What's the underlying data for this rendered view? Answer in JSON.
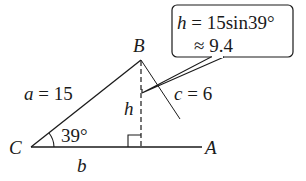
{
  "diagram": {
    "type": "triangle",
    "vertices": {
      "C": {
        "label": "C"
      },
      "B": {
        "label": "B"
      },
      "A": {
        "label": "A"
      }
    },
    "sides": {
      "a": {
        "var": "a",
        "eq": "=",
        "value": "15"
      },
      "c": {
        "var": "c",
        "eq": "=",
        "value": "6"
      },
      "b": {
        "var": "b"
      }
    },
    "angle_C": "39°",
    "altitude": {
      "var": "h"
    },
    "callout": {
      "line1_var": "h",
      "line1_rest": " = 15sin39°",
      "line2": "≈ 9.4"
    },
    "colors": {
      "stroke": "#1a1a1a",
      "background": "#ffffff"
    }
  }
}
